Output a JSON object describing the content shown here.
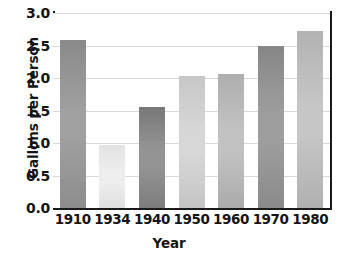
{
  "chart_data": {
    "type": "bar",
    "title": "",
    "xlabel": "Year",
    "ylabel": "Gallons per Person",
    "categories": [
      "1910",
      "1934",
      "1940",
      "1950",
      "1960",
      "1970",
      "1980"
    ],
    "values": [
      2.58,
      0.97,
      1.55,
      2.03,
      2.06,
      2.5,
      2.73
    ],
    "ylim": [
      0.0,
      3.0
    ],
    "ytick_labels": [
      "3.0",
      "2.5",
      "2.0",
      "1.5",
      "1.0",
      "0.5",
      "0.0"
    ],
    "ytick_values": [
      3.0,
      2.5,
      2.0,
      1.5,
      1.0,
      0.5,
      0.0
    ],
    "grid": true,
    "legend": false,
    "bar_colors": [
      {
        "top": "#8a8a8a",
        "mid": "#a0a0a0",
        "bottom": "#8d8d8d"
      },
      {
        "top": "#e2e2e2",
        "mid": "#eeeeee",
        "bottom": "#e0e0e0"
      },
      {
        "top": "#787878",
        "mid": "#949494",
        "bottom": "#7d7d7d"
      },
      {
        "top": "#c7c7c7",
        "mid": "#d7d7d7",
        "bottom": "#c5c5c5"
      },
      {
        "top": "#aeaeae",
        "mid": "#c2c2c2",
        "bottom": "#ababab"
      },
      {
        "top": "#868686",
        "mid": "#9e9e9e",
        "bottom": "#8a8a8a"
      },
      {
        "top": "#b2b2b2",
        "mid": "#c6c6c6",
        "bottom": "#b0b0b0"
      }
    ],
    "axis_color": "#1a1a1a",
    "grid_color": "#d9d9d9",
    "text_color": "#141414",
    "background": "#ffffff"
  }
}
